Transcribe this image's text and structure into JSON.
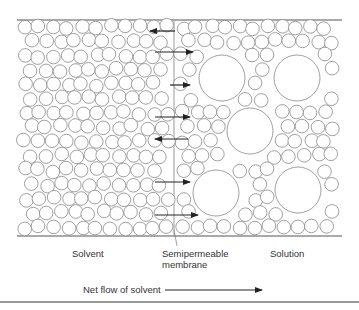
{
  "labels": {
    "solvent": "Solvent",
    "membrane_line1": "Semipermeable",
    "membrane_line2": "membrane",
    "solution": "Solution",
    "net_flow": "Net flow of solvent"
  },
  "colors": {
    "stroke": "#888888",
    "line": "#555555",
    "arrow": "#222222"
  },
  "container": {
    "x1": 17,
    "x2": 342,
    "top": 20,
    "bottom": 236,
    "membrane_x": 174
  },
  "arrows": [
    {
      "y": 31,
      "x1": 175,
      "x2": 150,
      "dir": "left"
    },
    {
      "y": 52,
      "x1": 155,
      "x2": 193,
      "dir": "right"
    },
    {
      "y": 85,
      "x1": 170,
      "x2": 190,
      "dir": "right"
    },
    {
      "y": 117,
      "x1": 155,
      "x2": 190,
      "dir": "right"
    },
    {
      "y": 139,
      "x1": 188,
      "x2": 155,
      "dir": "left"
    },
    {
      "y": 182,
      "x1": 155,
      "x2": 190,
      "dir": "right"
    },
    {
      "y": 215,
      "x1": 155,
      "x2": 198,
      "dir": "right"
    }
  ],
  "solute_particles": [
    {
      "cx": 222,
      "cy": 78,
      "r": 23
    },
    {
      "cx": 297,
      "cy": 78,
      "r": 23
    },
    {
      "cx": 250,
      "cy": 131,
      "r": 23
    },
    {
      "cx": 216,
      "cy": 193,
      "r": 23
    },
    {
      "cx": 298,
      "cy": 190,
      "r": 23
    }
  ],
  "net_flow_arrow": {
    "x1": 165,
    "x2": 262,
    "y": 290
  }
}
